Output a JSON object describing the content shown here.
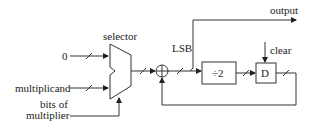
{
  "diagram": {
    "inputs": {
      "zero": "0",
      "multiplicand": "multiplicand",
      "bits_line1": "bits of",
      "bits_line2": "multiplier"
    },
    "labels": {
      "selector": "selector",
      "lsb": "LSB",
      "output": "output",
      "clear": "clear"
    },
    "blocks": {
      "adder": "+",
      "divide": "÷2",
      "register": "D"
    },
    "colors": {
      "line": "#333333",
      "background": "#ffffff"
    }
  }
}
